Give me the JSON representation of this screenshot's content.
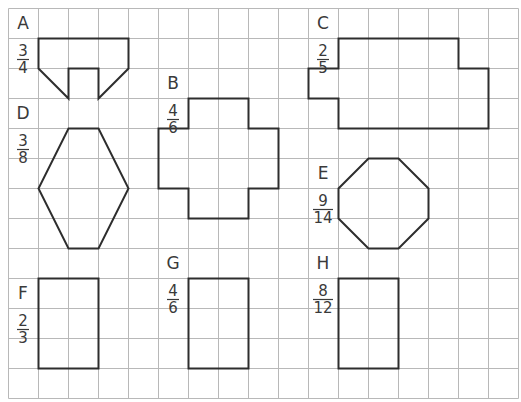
{
  "grid": {
    "origin_x": 8,
    "origin_y": 8,
    "cell": 30,
    "cols": 17,
    "rows": 13,
    "line_color": "#b8b8b8"
  },
  "shape_color": "#2e2e2e",
  "text_color": "#3a3a3a",
  "figures": [
    {
      "id": "A",
      "label": "A",
      "numerator": "3",
      "denominator": "4",
      "label_pos": [
        23,
        29
      ],
      "fraction_pos": [
        23,
        44
      ],
      "points": [
        [
          38,
          38
        ],
        [
          128,
          38
        ],
        [
          128,
          68
        ],
        [
          98,
          98
        ],
        [
          98,
          68
        ],
        [
          68,
          68
        ],
        [
          68,
          98
        ],
        [
          38,
          68
        ]
      ]
    },
    {
      "id": "B",
      "label": "B",
      "numerator": "4",
      "denominator": "6",
      "label_pos": [
        173,
        89
      ],
      "fraction_pos": [
        173,
        104
      ],
      "points": [
        [
          188,
          98
        ],
        [
          248,
          98
        ],
        [
          248,
          128
        ],
        [
          278,
          128
        ],
        [
          278,
          188
        ],
        [
          248,
          188
        ],
        [
          248,
          218
        ],
        [
          188,
          218
        ],
        [
          188,
          188
        ],
        [
          158,
          188
        ],
        [
          158,
          128
        ],
        [
          188,
          128
        ]
      ]
    },
    {
      "id": "C",
      "label": "C",
      "numerator": "2",
      "denominator": "5",
      "label_pos": [
        323,
        29
      ],
      "fraction_pos": [
        323,
        44
      ],
      "points": [
        [
          338,
          38
        ],
        [
          458,
          38
        ],
        [
          458,
          68
        ],
        [
          488,
          68
        ],
        [
          488,
          128
        ],
        [
          338,
          128
        ],
        [
          338,
          98
        ],
        [
          308,
          98
        ],
        [
          308,
          68
        ],
        [
          338,
          68
        ]
      ]
    },
    {
      "id": "D",
      "label": "D",
      "numerator": "3",
      "denominator": "8",
      "label_pos": [
        23,
        119
      ],
      "fraction_pos": [
        23,
        134
      ],
      "points": [
        [
          68,
          128
        ],
        [
          98,
          128
        ],
        [
          128,
          188
        ],
        [
          98,
          248
        ],
        [
          68,
          248
        ],
        [
          38,
          188
        ]
      ]
    },
    {
      "id": "E",
      "label": "E",
      "numerator": "9",
      "denominator": "14",
      "label_pos": [
        323,
        179
      ],
      "fraction_pos": [
        323,
        194
      ],
      "points": [
        [
          368,
          158
        ],
        [
          398,
          158
        ],
        [
          428,
          188
        ],
        [
          428,
          218
        ],
        [
          398,
          248
        ],
        [
          368,
          248
        ],
        [
          338,
          218
        ],
        [
          338,
          188
        ]
      ]
    },
    {
      "id": "F",
      "label": "F",
      "numerator": "2",
      "denominator": "3",
      "label_pos": [
        23,
        299
      ],
      "fraction_pos": [
        23,
        314
      ],
      "points": [
        [
          38,
          278
        ],
        [
          98,
          278
        ],
        [
          98,
          368
        ],
        [
          38,
          368
        ]
      ]
    },
    {
      "id": "G",
      "label": "G",
      "numerator": "4",
      "denominator": "6",
      "label_pos": [
        173,
        269
      ],
      "fraction_pos": [
        173,
        284
      ],
      "points": [
        [
          188,
          278
        ],
        [
          248,
          278
        ],
        [
          248,
          368
        ],
        [
          188,
          368
        ]
      ]
    },
    {
      "id": "H",
      "label": "H",
      "numerator": "8",
      "denominator": "12",
      "label_pos": [
        323,
        269
      ],
      "fraction_pos": [
        323,
        284
      ],
      "points": [
        [
          338,
          278
        ],
        [
          398,
          278
        ],
        [
          398,
          368
        ],
        [
          338,
          368
        ]
      ]
    }
  ]
}
